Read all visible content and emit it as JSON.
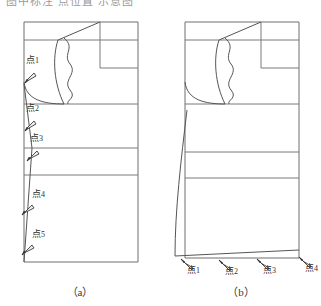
{
  "figure": {
    "clipped_header_text": "图中标注 点位置 示意图",
    "panels": [
      {
        "id": "a",
        "caption": "（a）",
        "point_markers": [
          {
            "label_prefix": "点",
            "index": "1",
            "icon": "arrow-pointer-icon",
            "label_x": 26,
            "label_y": 62,
            "tip_x": 24,
            "tip_y": 84,
            "tail_x": 34,
            "tail_y": 73
          },
          {
            "label_prefix": "点",
            "index": "2",
            "icon": "arrow-pointer-icon",
            "label_x": 26,
            "label_y": 110,
            "tip_x": 24,
            "tip_y": 132,
            "tail_x": 34,
            "tail_y": 121
          },
          {
            "label_prefix": "点",
            "index": "3",
            "icon": "arrow-pointer-icon",
            "label_x": 30,
            "label_y": 140,
            "tip_x": 26,
            "tip_y": 162,
            "tail_x": 37,
            "tail_y": 151
          },
          {
            "label_prefix": "点",
            "index": "4",
            "icon": "arrow-pointer-icon",
            "label_x": 30,
            "label_y": 196,
            "tip_x": 21,
            "tip_y": 216,
            "tail_x": 32,
            "tail_y": 205
          },
          {
            "label_prefix": "点",
            "index": "5",
            "icon": "arrow-pointer-icon",
            "label_x": 30,
            "label_y": 235,
            "tip_x": 21,
            "tip_y": 256,
            "tail_x": 32,
            "tail_y": 245
          }
        ]
      },
      {
        "id": "b",
        "caption": "（b）",
        "point_markers": [
          {
            "label_prefix": "点",
            "index": "1",
            "icon": "arrow-pointer-icon",
            "label_x": 24,
            "label_y": 269,
            "tip_x": 21,
            "tip_y": 259,
            "tail_x": 31,
            "tail_y": 270
          },
          {
            "label_prefix": "点",
            "index": "2",
            "icon": "arrow-pointer-icon",
            "label_x": 62,
            "label_y": 269,
            "tip_x": 59,
            "tip_y": 260,
            "tail_x": 69,
            "tail_y": 271
          },
          {
            "label_prefix": "点",
            "index": "3",
            "icon": "arrow-pointer-icon",
            "label_x": 100,
            "label_y": 268,
            "tip_x": 97,
            "tip_y": 259,
            "tail_x": 107,
            "tail_y": 270
          },
          {
            "label_prefix": "点",
            "index": "4",
            "icon": "arrow-pointer-icon",
            "label_x": 142,
            "label_y": 266,
            "tip_x": 139,
            "tip_y": 257,
            "tail_x": 149,
            "tail_y": 268
          }
        ]
      }
    ]
  },
  "colors": {
    "outline_stroke": "#6f6f6f",
    "detail_stroke": "#555555",
    "marker_fill": "#efefef",
    "marker_stroke": "#303030",
    "text": "#2f2f2f",
    "background": "#ffffff"
  }
}
